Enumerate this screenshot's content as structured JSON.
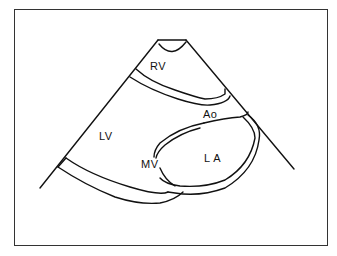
{
  "diagram": {
    "type": "echocardiogram parasternal long-axis schematic",
    "labels": {
      "rv": "RV",
      "lv": "LV",
      "ao": "Ao",
      "mv": "MV",
      "la": "L A"
    },
    "colors": {
      "line": "#111111",
      "background": "#ffffff",
      "frame": "#333333"
    }
  }
}
